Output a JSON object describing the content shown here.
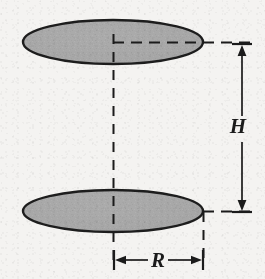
{
  "figure": {
    "title": "Cylinder radius and height dimension diagram",
    "background_color": "#f4f3f1",
    "line_color": "#1b1b1b",
    "shape_fill_color": "#a8a8a8",
    "shape_stroke_color": "#1d1d1d"
  },
  "shapes": [
    {
      "name": "top-ellipse",
      "role": "top circular face of cylinder",
      "cx": 113,
      "cy": 42,
      "rx": 90,
      "ry": 22,
      "fill": "#a8a8a8",
      "stroke": "#1d1d1d"
    },
    {
      "name": "bottom-ellipse",
      "role": "bottom circular face of cylinder",
      "cx": 113,
      "cy": 211,
      "rx": 90,
      "ry": 21,
      "fill": "#a8a8a8",
      "stroke": "#1d1d1d"
    }
  ],
  "construction_lines": [
    {
      "name": "center-axis-dashed-line",
      "orientation": "vertical",
      "x": 113,
      "y1": 34,
      "y2": 260
    },
    {
      "name": "top-radius-dashed-line",
      "orientation": "horizontal",
      "y": 42,
      "x1": 113,
      "x2": 251
    },
    {
      "name": "bottom-extension-dashed-line",
      "orientation": "horizontal",
      "y": 211,
      "x1": 203,
      "x2": 251
    },
    {
      "name": "right-edge-dashed-line",
      "orientation": "vertical",
      "x": 203,
      "y1": 212,
      "y2": 260
    }
  ],
  "dimensions": [
    {
      "name": "height-dimension",
      "label": "H",
      "symbol_meaning": "height of cylinder",
      "orientation": "vertical",
      "x": 242,
      "y_start": 44,
      "y_end": 212,
      "label_x": 238,
      "label_y": 133,
      "has_arrowheads": true,
      "has_end_ticks": true
    },
    {
      "name": "radius-dimension",
      "label": "R",
      "symbol_meaning": "radius of cylinder",
      "orientation": "horizontal",
      "y": 260,
      "x_start": 115,
      "x_end": 201,
      "label_x": 158,
      "label_y": 267,
      "has_arrowheads": true,
      "has_end_ticks": true
    }
  ],
  "labels": {
    "height": "H",
    "radius": "R"
  }
}
